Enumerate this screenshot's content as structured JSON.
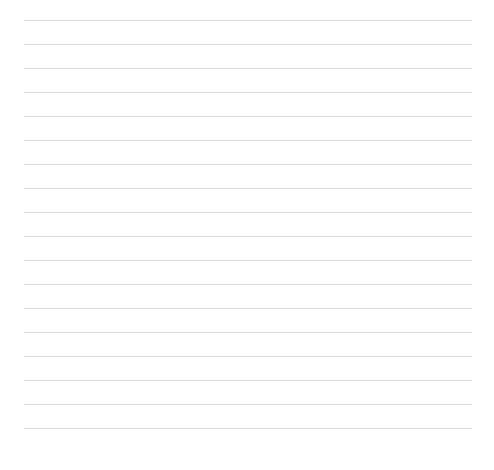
{
  "page": {
    "type": "lined-paper",
    "background_color": "#ffffff",
    "line_color": "#d9d9d9",
    "line_count": 18,
    "first_line_y": 20,
    "line_spacing": 24,
    "line_left": 24,
    "line_right": 472,
    "lines": [
      {
        "text": ""
      },
      {
        "text": ""
      },
      {
        "text": ""
      },
      {
        "text": ""
      },
      {
        "text": ""
      },
      {
        "text": ""
      },
      {
        "text": ""
      },
      {
        "text": ""
      },
      {
        "text": ""
      },
      {
        "text": ""
      },
      {
        "text": ""
      },
      {
        "text": ""
      },
      {
        "text": ""
      },
      {
        "text": ""
      },
      {
        "text": ""
      },
      {
        "text": ""
      },
      {
        "text": ""
      },
      {
        "text": ""
      }
    ]
  }
}
